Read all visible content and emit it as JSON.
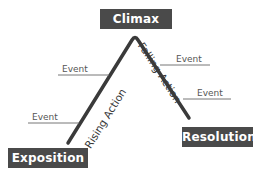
{
  "diagram": {
    "type": "plot-structure-triangle",
    "nodes": {
      "climax": "Climax",
      "exposition": "Exposition",
      "resolution": "Resolution"
    },
    "edges": {
      "rising_action": "Rising Action",
      "falling_action": "Falling Action"
    },
    "events": {
      "left_upper": "Event",
      "left_lower": "Event",
      "right_upper": "Event",
      "right_lower": "Event"
    },
    "colors": {
      "box_fill": "#4a4a4a",
      "box_text": "#ffffff",
      "line": "#3a3a3a",
      "event_text": "#555555",
      "event_line": "#777777"
    }
  }
}
